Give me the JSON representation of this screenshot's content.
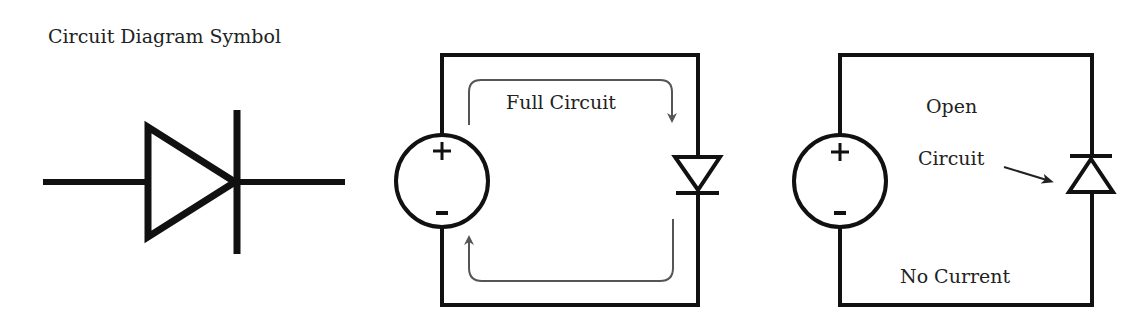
{
  "panels": [
    {
      "id": "symbol",
      "title": "Circuit Diagram Symbol",
      "component": "diode"
    },
    {
      "id": "forward-bias",
      "label": "Full Circuit",
      "source": {
        "plus": "+",
        "minus": "-"
      },
      "diode_orientation": "forward",
      "current_flow": true
    },
    {
      "id": "reverse-bias",
      "label_line1": "Open",
      "label_line2": "Circuit",
      "footer": "No Current",
      "source": {
        "plus": "+",
        "minus": "-"
      },
      "diode_orientation": "reverse",
      "current_flow": false
    }
  ],
  "colors": {
    "wire": "#111111",
    "arrow": "#555555",
    "text": "#222222",
    "background": "#ffffff"
  }
}
